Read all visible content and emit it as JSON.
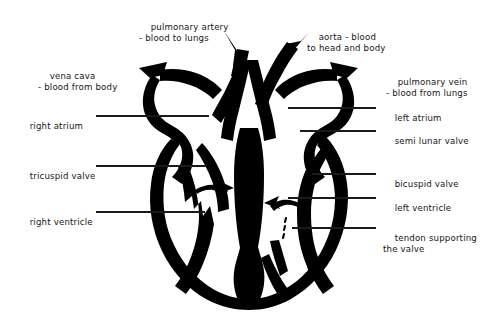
{
  "figure": {
    "background_color": "#ffffff",
    "ink_color": "#000000",
    "leader_line_color": "#1a1a1a"
  },
  "labels": [
    {
      "id": "pulmonary-artery",
      "line1": "pulmonary artery",
      "line2": "- blood to lungs"
    },
    {
      "id": "aorta",
      "line1": "aorta - blood",
      "line2": "to head and body"
    },
    {
      "id": "vena-cava",
      "line1": "vena cava",
      "line2": "- blood from body"
    },
    {
      "id": "pulmonary-vein",
      "line1": "pulmonary vein",
      "line2": "- blood from lungs"
    },
    {
      "id": "right-atrium",
      "line1": "right atrium",
      "line2": ""
    },
    {
      "id": "left-atrium",
      "line1": "left atrium",
      "line2": ""
    },
    {
      "id": "semi-lunar-valve",
      "line1": "semi lunar valve",
      "line2": ""
    },
    {
      "id": "tricuspid-valve",
      "line1": "tricuspid valve",
      "line2": ""
    },
    {
      "id": "bicuspid-valve",
      "line1": "bicuspid valve",
      "line2": ""
    },
    {
      "id": "right-ventricle",
      "line1": "right ventricle",
      "line2": ""
    },
    {
      "id": "left-ventricle",
      "line1": "left ventricle",
      "line2": ""
    },
    {
      "id": "tendon-supporting-the-valve",
      "line1": "tendon supporting",
      "line2": "the valve"
    }
  ]
}
